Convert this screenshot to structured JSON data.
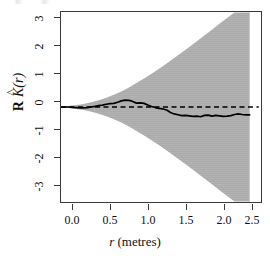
{
  "figure": {
    "background_color": "#ffffff",
    "frame_color": "#3a3a3a",
    "envelope_color": "#ababab",
    "line_color": "#000000"
  },
  "axes": {
    "x": {
      "label_prefix": "r",
      "label_suffix": " (metres)",
      "ticks": [
        "0.0",
        "0.5",
        "1.0",
        "1.5",
        "2.0",
        "2.5"
      ],
      "tick_values": [
        0.0,
        0.5,
        1.0,
        1.5,
        2.0,
        2.5
      ],
      "range": [
        0.0,
        2.65
      ]
    },
    "y": {
      "label_r": "R",
      "label_k": "K",
      "label_hat": "^",
      "label_arg": "(r)",
      "ticks": [
        "3",
        "2",
        "1",
        "0",
        "-1",
        "-2",
        "-3"
      ],
      "tick_values": [
        3,
        2,
        1,
        0,
        -1,
        -2,
        -3
      ],
      "range": [
        -3.42,
        3.42
      ]
    }
  },
  "chart_data": {
    "type": "line",
    "title": "",
    "subtitle": "",
    "xlabel": "r (metres)",
    "ylabel": "R K̂(r)",
    "xlim": [
      0.0,
      2.65
    ],
    "ylim": [
      -3.42,
      3.42
    ],
    "grid": false,
    "legend": null,
    "annotations": [],
    "series": [
      {
        "name": "observed",
        "style": "solid",
        "color": "#000000",
        "x": [
          0.0,
          0.05,
          0.1,
          0.15,
          0.2,
          0.25,
          0.3,
          0.35,
          0.4,
          0.45,
          0.5,
          0.55,
          0.6,
          0.65,
          0.7,
          0.75,
          0.8,
          0.85,
          0.9,
          0.95,
          1.0,
          1.05,
          1.1,
          1.15,
          1.2,
          1.25,
          1.3,
          1.35,
          1.4,
          1.45,
          1.5,
          1.55,
          1.6,
          1.65,
          1.7,
          1.75,
          1.8,
          1.85,
          1.9,
          1.95,
          2.0,
          2.05,
          2.1,
          2.15,
          2.2,
          2.25,
          2.3,
          2.35,
          2.4,
          2.45,
          2.5
        ],
        "y": [
          0.0,
          0.0,
          0.0,
          -0.01,
          -0.02,
          -0.03,
          -0.03,
          -0.02,
          0.0,
          0.02,
          0.05,
          0.07,
          0.1,
          0.12,
          0.13,
          0.17,
          0.22,
          0.25,
          0.24,
          0.2,
          0.14,
          0.15,
          0.13,
          0.07,
          0.02,
          -0.02,
          -0.05,
          -0.07,
          -0.11,
          -0.2,
          -0.25,
          -0.28,
          -0.31,
          -0.3,
          -0.32,
          -0.34,
          -0.33,
          -0.35,
          -0.3,
          -0.29,
          -0.33,
          -0.3,
          -0.32,
          -0.34,
          -0.33,
          -0.31,
          -0.27,
          -0.25,
          -0.27,
          -0.28,
          -0.28
        ]
      },
      {
        "name": "theoretical",
        "style": "dashed",
        "color": "#000000",
        "x": [
          0.0,
          2.62
        ],
        "y": [
          0.0,
          0.0
        ]
      }
    ],
    "bands": [
      {
        "name": "simulation envelope",
        "fill": "#ababab",
        "x": [
          0.0,
          0.1,
          0.2,
          0.3,
          0.4,
          0.5,
          0.6,
          0.7,
          0.8,
          0.9,
          1.0,
          1.1,
          1.2,
          1.3,
          1.4,
          1.5,
          1.6,
          1.7,
          1.8,
          1.9,
          2.0,
          2.1,
          2.2,
          2.3,
          2.4,
          2.5
        ],
        "upper": [
          0.02,
          0.04,
          0.07,
          0.11,
          0.17,
          0.24,
          0.33,
          0.44,
          0.56,
          0.7,
          0.86,
          1.03,
          1.2,
          1.38,
          1.57,
          1.76,
          1.96,
          2.16,
          2.37,
          2.57,
          2.78,
          3.0,
          3.2,
          3.4,
          3.4,
          3.4
        ],
        "lower": [
          -0.02,
          -0.04,
          -0.07,
          -0.11,
          -0.17,
          -0.24,
          -0.33,
          -0.44,
          -0.56,
          -0.7,
          -0.86,
          -1.03,
          -1.2,
          -1.38,
          -1.57,
          -1.76,
          -1.96,
          -2.16,
          -2.37,
          -2.57,
          -2.78,
          -3.0,
          -3.2,
          -3.4,
          -3.4,
          -3.4
        ]
      }
    ]
  }
}
